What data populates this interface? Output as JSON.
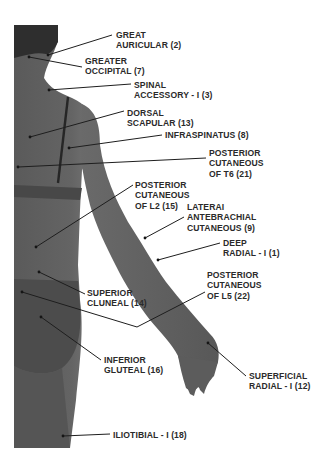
{
  "diagram": {
    "type": "anatomical-nerve-map",
    "view": "posterior body (back view, right arm)",
    "colors": {
      "background": "#ffffff",
      "skin": "#5f5f5f",
      "skin_light": "#7a7a7a",
      "hair": "#2e2e2e",
      "bra": "#4a4a4a",
      "line": "#1e1e1e",
      "text": "#2a2a2a"
    },
    "labels": [
      {
        "id": "great-auricular",
        "lines": [
          "GREAT",
          "AURICULAR (2)"
        ],
        "x": 116,
        "y": 30,
        "point": [
          48,
          55
        ],
        "anchor": [
          112,
          35
        ]
      },
      {
        "id": "greater-occipital",
        "lines": [
          "GREATER",
          "OCCIPITAL (7)"
        ],
        "x": 85,
        "y": 56,
        "point": [
          29,
          57
        ],
        "anchor": [
          82,
          67
        ]
      },
      {
        "id": "spinal-accessory",
        "lines": [
          "SPINAL",
          "ACCESSORY - I (3)"
        ],
        "x": 134,
        "y": 80,
        "point": [
          49,
          90
        ],
        "anchor": [
          131,
          84
        ]
      },
      {
        "id": "dorsal-scapular",
        "lines": [
          "DORSAL",
          "SCAPULAR (13)"
        ],
        "x": 127,
        "y": 108,
        "point": [
          30,
          137
        ],
        "anchor": [
          124,
          111
        ]
      },
      {
        "id": "infraspinatus",
        "lines": [
          "INFRASPINATUS (8)"
        ],
        "x": 165,
        "y": 130,
        "point": [
          69,
          148
        ],
        "anchor": [
          162,
          135
        ]
      },
      {
        "id": "posterior-cutaneous-t6",
        "lines": [
          "POSTERIOR",
          "CUTANEOUS",
          "OF T6 (21)"
        ],
        "x": 209,
        "y": 148,
        "point": [
          18,
          167
        ],
        "anchor": [
          206,
          158
        ]
      },
      {
        "id": "posterior-cutaneous-l2",
        "lines": [
          "POSTERIOR",
          "CUTANEOUS",
          "OF L2 (15)"
        ],
        "x": 135,
        "y": 180,
        "point": [
          36,
          247
        ],
        "anchor": [
          133,
          185
        ]
      },
      {
        "id": "lateral-antebrachial-cutaneous",
        "lines": [
          "LATERAI",
          "ANTEBRACHIAL",
          "CUTANEOUS (9)"
        ],
        "x": 187,
        "y": 202,
        "point": [
          145,
          238
        ],
        "anchor": [
          184,
          217
        ]
      },
      {
        "id": "deep-radial",
        "lines": [
          "DEEP",
          "RADIAL - I (1)"
        ],
        "x": 223,
        "y": 238,
        "point": [
          158,
          260
        ],
        "anchor": [
          220,
          243
        ]
      },
      {
        "id": "superior-cluneal",
        "lines": [
          "SUPERIOR",
          "CLUNEAL (14)"
        ],
        "x": 87,
        "y": 288,
        "point": [
          39,
          272
        ],
        "anchor": [
          85,
          294
        ]
      },
      {
        "id": "posterior-cutaneous-l5",
        "lines": [
          "POSTERIOR",
          "CUTANEOUS",
          "OF L5 (22)"
        ],
        "x": 207,
        "y": 270,
        "point": [
          22,
          292
        ],
        "anchor": [
          205,
          292
        ],
        "elbow": [
          137,
          327
        ]
      },
      {
        "id": "inferior-gluteal",
        "lines": [
          "INFERIOR",
          "GLUTEAL (16)"
        ],
        "x": 104,
        "y": 355,
        "point": [
          41,
          317
        ],
        "anchor": [
          101,
          360
        ]
      },
      {
        "id": "superficial-radial",
        "lines": [
          "SUPERFICIAL",
          "RADIAL - I (12)"
        ],
        "x": 249,
        "y": 371,
        "point": [
          208,
          343
        ],
        "anchor": [
          246,
          376
        ]
      },
      {
        "id": "iliotibial",
        "lines": [
          "ILIOTIBIAL - I (18)"
        ],
        "x": 113,
        "y": 430,
        "point": [
          63,
          436
        ],
        "anchor": [
          110,
          434
        ]
      }
    ]
  }
}
